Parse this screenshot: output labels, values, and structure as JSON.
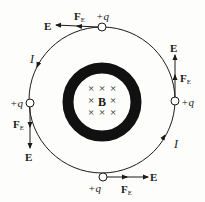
{
  "diagram": {
    "colors": {
      "ink": "#1a1a1a",
      "background": "#fdfdfb",
      "ring": "#111111"
    },
    "center_label": "B",
    "field_symbol": "×",
    "current_label": "I",
    "charges": [
      {
        "id": "top",
        "label": "+q",
        "E_label": "E",
        "F_label": "F",
        "F_sub": "E"
      },
      {
        "id": "right",
        "label": "+q",
        "E_label": "E",
        "F_label": "F",
        "F_sub": "E"
      },
      {
        "id": "bottom",
        "label": "+q",
        "E_label": "E",
        "F_label": "F",
        "F_sub": "E"
      },
      {
        "id": "left",
        "label": "+q",
        "E_label": "E",
        "F_label": "F",
        "F_sub": "E"
      }
    ],
    "current_labels": [
      {
        "position": "upper-left",
        "text": "I"
      },
      {
        "position": "lower-right",
        "text": "I"
      }
    ]
  }
}
